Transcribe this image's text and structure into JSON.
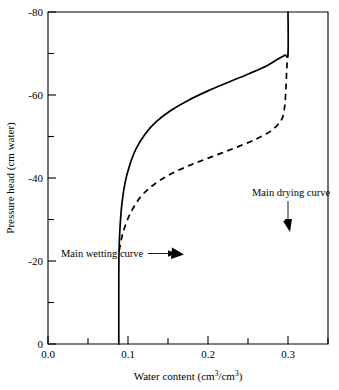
{
  "chart_data": {
    "type": "line",
    "title": "",
    "xlabel": "Water content (cm3/cm3)",
    "ylabel": "Pressure head (cm water)",
    "xlim": [
      0.0,
      0.35
    ],
    "ylim": [
      -80,
      0
    ],
    "grid": false,
    "legend_position": "inline-annotations",
    "x_ticks_major": [
      "0.0",
      "0.1",
      "0.2",
      "0.3"
    ],
    "x_ticks_major_values": [
      0.0,
      0.1,
      0.2,
      0.3
    ],
    "x_ticks_minor_values": [
      0.05,
      0.15,
      0.25
    ],
    "y_ticks_major": [
      "-80",
      "-60",
      "-40",
      "-20",
      "0"
    ],
    "y_ticks_major_values": [
      -80,
      -60,
      -40,
      -20,
      0
    ],
    "y_ticks_minor_values": [
      -70,
      -50,
      -30,
      -10
    ],
    "series": [
      {
        "name": "Main wetting curve",
        "style": "solid",
        "points": [
          [
            0.0885,
            -80.0
          ],
          [
            0.0885,
            -64.0
          ],
          [
            0.0888,
            -58.0
          ],
          [
            0.09,
            -52.0
          ],
          [
            0.0925,
            -46.0
          ],
          [
            0.0965,
            -41.0
          ],
          [
            0.102,
            -37.0
          ],
          [
            0.11,
            -33.0
          ],
          [
            0.121,
            -29.5
          ],
          [
            0.135,
            -26.5
          ],
          [
            0.153,
            -23.8
          ],
          [
            0.175,
            -21.3
          ],
          [
            0.2,
            -19.0
          ],
          [
            0.227,
            -16.8
          ],
          [
            0.252,
            -14.8
          ],
          [
            0.273,
            -13.0
          ],
          [
            0.287,
            -11.4
          ],
          [
            0.296,
            -10.4
          ],
          [
            0.3,
            -10.0
          ],
          [
            0.3,
            0.0
          ]
        ]
      },
      {
        "name": "Main drying curve",
        "style": "dashed",
        "points": [
          [
            0.089,
            -57.5
          ],
          [
            0.094,
            -53.0
          ],
          [
            0.103,
            -48.5
          ],
          [
            0.116,
            -44.5
          ],
          [
            0.133,
            -41.5
          ],
          [
            0.154,
            -39.0
          ],
          [
            0.179,
            -36.8
          ],
          [
            0.206,
            -34.8
          ],
          [
            0.233,
            -32.8
          ],
          [
            0.258,
            -30.8
          ],
          [
            0.276,
            -29.0
          ],
          [
            0.286,
            -27.4
          ],
          [
            0.293,
            -25.5
          ],
          [
            0.296,
            -22.5
          ],
          [
            0.2975,
            -18.0
          ],
          [
            0.2985,
            -13.5
          ],
          [
            0.3,
            -10.0
          ]
        ]
      }
    ],
    "annotations": [
      {
        "text": "Main drying curve",
        "target_point": [
          0.2885,
          -27.2
        ],
        "arrow_direction": "down"
      },
      {
        "text": "Main wetting curve",
        "target_point": [
          0.176,
          -21.2
        ],
        "arrow_direction": "right"
      }
    ]
  }
}
